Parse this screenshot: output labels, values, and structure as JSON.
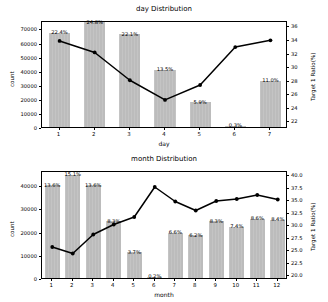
{
  "figure": {
    "width": 328,
    "height": 302,
    "background": "#ffffff",
    "bar_color": "#c0c0c0",
    "line_color": "#000000"
  },
  "chart_data": [
    {
      "type": "bar",
      "title": "day Distribution",
      "xlabel": "day",
      "ylabel": "count",
      "y2label": "Target 1 Ratio(%)",
      "categories": [
        "1",
        "2",
        "3",
        "4",
        "5",
        "6",
        "7"
      ],
      "values": [
        67000,
        74500,
        66000,
        40500,
        17500,
        900,
        33000
      ],
      "bar_labels": [
        "22.4%",
        "24.8%",
        "22.1%",
        "13.5%",
        "5.9%",
        "0.3%",
        "11.0%"
      ],
      "ylim": [
        0,
        76000
      ],
      "yticks": [
        "0",
        "10000",
        "20000",
        "30000",
        "40000",
        "50000",
        "60000",
        "70000"
      ],
      "ytick_values": [
        0,
        10000,
        20000,
        30000,
        40000,
        50000,
        60000,
        70000
      ],
      "y2lim": [
        21.0,
        36.8
      ],
      "y2ticks": [
        "22",
        "24",
        "26",
        "28",
        "30",
        "32",
        "34",
        "36"
      ],
      "y2tick_values": [
        22,
        24,
        26,
        28,
        30,
        32,
        34,
        36
      ],
      "series": [
        {
          "name": "Target 1 Ratio(%)",
          "axis": "right",
          "marker": "o",
          "values": [
            34.0,
            32.3,
            28.2,
            25.3,
            27.5,
            33.1,
            34.1
          ]
        }
      ],
      "grid": false,
      "legend": "none"
    },
    {
      "type": "bar",
      "title": "month Distribution",
      "xlabel": "month",
      "ylabel": "count",
      "y2label": "Target 1 Ratio(%)",
      "categories": [
        "1",
        "2",
        "3",
        "4",
        "5",
        "6",
        "7",
        "8",
        "9",
        "10",
        "11",
        "12"
      ],
      "values": [
        40000,
        44500,
        40000,
        24500,
        11000,
        600,
        19500,
        18500,
        24500,
        22000,
        25500,
        25000
      ],
      "bar_labels": [
        "13.6%",
        "15.1%",
        "13.6%",
        "8.3%",
        "3.7%",
        "0.2%",
        "6.6%",
        "6.2%",
        "8.3%",
        "7.4%",
        "8.6%",
        "8.4%"
      ],
      "ylim": [
        0,
        46500
      ],
      "yticks": [
        "0",
        "10000",
        "20000",
        "30000",
        "40000"
      ],
      "ytick_values": [
        0,
        10000,
        20000,
        30000,
        40000
      ],
      "y2lim": [
        19.2,
        40.8
      ],
      "y2ticks": [
        "20.0",
        "22.5",
        "25.0",
        "27.5",
        "30.0",
        "32.5",
        "35.0",
        "37.5",
        "40.0"
      ],
      "y2tick_values": [
        20.0,
        22.5,
        25.0,
        27.5,
        30.0,
        32.5,
        35.0,
        37.5,
        40.0
      ],
      "series": [
        {
          "name": "Target 1 Ratio(%)",
          "axis": "right",
          "marker": "o",
          "values": [
            25.8,
            24.5,
            28.3,
            30.3,
            31.8,
            37.8,
            34.9,
            33.1,
            35.0,
            35.4,
            36.2,
            35.3
          ]
        }
      ],
      "grid": false,
      "legend": "none"
    }
  ]
}
